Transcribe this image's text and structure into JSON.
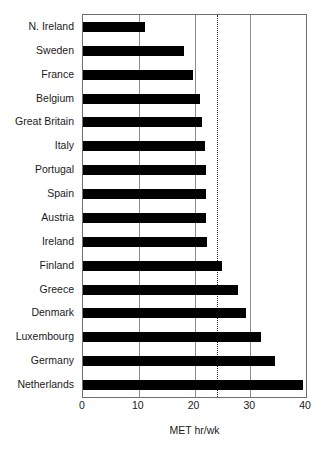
{
  "chart_data": {
    "type": "bar",
    "orientation": "horizontal",
    "title": "",
    "xlabel": "MET hr/wk",
    "ylabel": "",
    "xlim": [
      0,
      40
    ],
    "xticks": [
      0,
      10,
      20,
      30,
      40
    ],
    "xtick_labels": [
      "0",
      "10",
      "20",
      "30",
      "40"
    ],
    "grid": true,
    "gridlines_x": [
      10,
      20,
      30
    ],
    "legend": "none",
    "reference_line": {
      "value": 24,
      "style": "dotted",
      "color": "#2a2a2a",
      "label": ""
    },
    "bar_color": "#000000",
    "categories": [
      "N. Ireland",
      "Sweden",
      "France",
      "Belgium",
      "Great Britain",
      "Italy",
      "Portugal",
      "Spain",
      "Austria",
      "Ireland",
      "Finland",
      "Greece",
      "Denmark",
      "Luxembourg",
      "Germany",
      "Netherlands"
    ],
    "values": [
      11.1,
      18.1,
      19.8,
      20.9,
      21.3,
      21.9,
      22.0,
      22.0,
      22.1,
      22.2,
      25.0,
      27.8,
      29.2,
      31.9,
      34.5,
      39.4
    ]
  },
  "axis": {
    "x_title": "MET hr/wk"
  }
}
